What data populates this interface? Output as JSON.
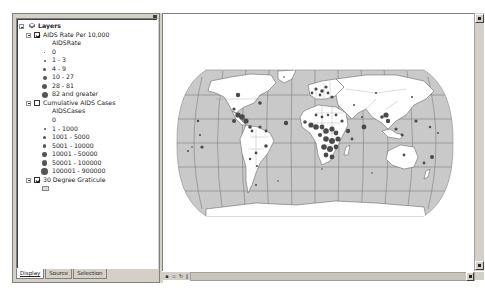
{
  "toc": {
    "root_label": "Layers",
    "layers": [
      {
        "name": "AIDS Rate Per 10,000",
        "checked": true,
        "field": "AIDSRate",
        "classes": [
          "0",
          "1 - 3",
          "4 - 9",
          "10 - 27",
          "28 - 81",
          "82 and greater"
        ]
      },
      {
        "name": "Cumulative AIDS Cases",
        "checked": false,
        "field": "AIDSCases",
        "classes": [
          "0",
          "1 - 1000",
          "1001 - 5000",
          "5001 - 10000",
          "10001 - 50000",
          "50001 - 100000",
          "100001 - 900000"
        ]
      },
      {
        "name": "30 Degree Graticule",
        "checked": true
      }
    ],
    "tabs": [
      {
        "label": "Display",
        "active": true
      },
      {
        "label": "Source",
        "active": false
      },
      {
        "label": "Selection",
        "active": false
      }
    ]
  },
  "map": {
    "projection": "Robinson world map",
    "ocean_color": "#c8c8c8",
    "land_color": "#ffffff",
    "graticule_color": "#707070",
    "symbol_color": "#505050"
  },
  "statusbar": {
    "nav_buttons": [
      "layout-view",
      "data-view",
      "refresh",
      "pause",
      "scroll-left"
    ]
  }
}
